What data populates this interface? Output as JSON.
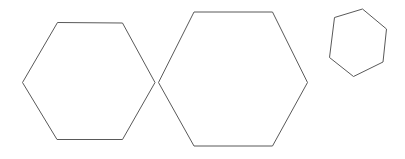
{
  "canvas": {
    "width": 405,
    "height": 159,
    "background_color": "#ffffff",
    "description": "Three outlined hexagons on a plain white background"
  },
  "style": {
    "stroke_color": "#595959",
    "stroke_width": 1,
    "fill": "none"
  },
  "shapes": [
    {
      "id": "hexagon-left",
      "name": "hexagon-left",
      "sides": 6,
      "label": "Left medium hexagon",
      "orientation": "flat-top",
      "points": "57.5,22.5 122.5,23 155,82.5 122.5,139.5 57,139.5 22.5,82.5",
      "bbox": {
        "x": 22.5,
        "y": 22.5,
        "width": 132.5,
        "height": 117
      },
      "center": {
        "x": 88.8,
        "y": 81
      }
    },
    {
      "id": "hexagon-middle",
      "name": "hexagon-middle",
      "sides": 6,
      "label": "Middle large hexagon",
      "orientation": "flat-top",
      "points": "194,12 272.5,12 307.5,82.5 272.5,146 194,146 158.5,82.5",
      "bbox": {
        "x": 158.5,
        "y": 12,
        "width": 149,
        "height": 134
      },
      "center": {
        "x": 233,
        "y": 79
      }
    },
    {
      "id": "hexagon-right",
      "name": "hexagon-right",
      "sides": 6,
      "label": "Right small irregular hexagon",
      "orientation": "irregular",
      "points": "362.5,9 386.5,29 383,62 353.5,76.5 329.5,57.5 334.5,17.5",
      "bbox": {
        "x": 329.5,
        "y": 9,
        "width": 57,
        "height": 67.5
      },
      "center": {
        "x": 358.3,
        "y": 41.9
      }
    }
  ]
}
